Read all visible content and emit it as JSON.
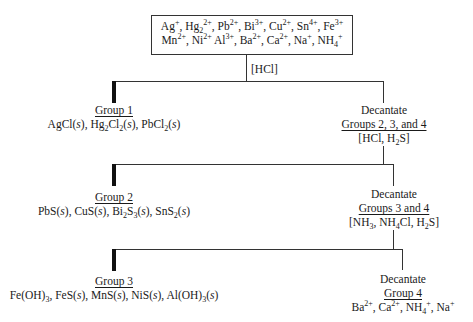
{
  "diagram": {
    "type": "qualitative-analysis-flowchart",
    "start_box": {
      "line1": "Ag+, Hg2 2+, Pb2+, Bi3+, Cu2+, Sn4+, Fe3+",
      "line2": "Mn2+, Ni2+ Al3+, Ba2+, Ca2+, Na+, NH4+"
    },
    "reagent_1": "[HCl]",
    "group1": {
      "title": "Group 1",
      "precipitates": "AgCl(s), Hg2Cl2(s), PbCl2(s)"
    },
    "decant_1": {
      "action": "Decantate",
      "groups": "Groups 2, 3, and 4",
      "reagent": "[HCl, H2S]"
    },
    "group2": {
      "title": "Group 2",
      "precipitates": "PbS(s), CuS(s), Bi2S3(s), SnS2(s)"
    },
    "decant_2": {
      "action": "Decantate",
      "groups": "Groups 3 and 4",
      "reagent": "[NH3, NH4Cl, H2S]"
    },
    "group3": {
      "title": "Group 3",
      "precipitates": "Fe(OH)3, FeS(s), MnS(s), NiS(s), Al(OH)3(s)"
    },
    "decant_3": {
      "action": "Decantate",
      "groups": "Group 4",
      "ions": "Ba2+, Ca2+, NH4+, Na+"
    }
  }
}
